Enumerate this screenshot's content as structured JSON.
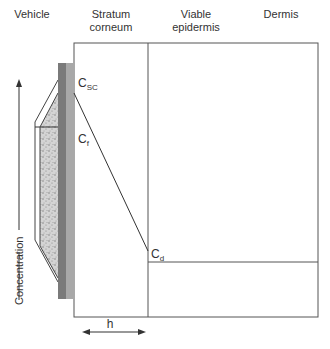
{
  "headers": {
    "vehicle": "Vehicle",
    "stratum_corneum_line1": "Stratum",
    "stratum_corneum_line2": "corneum",
    "viable_epidermis_line1": "Viable",
    "viable_epidermis_line2": "epidermis",
    "dermis": "Dermis"
  },
  "labels": {
    "c_sc_main": "C",
    "c_sc_sub": "SC",
    "c_f_main": "C",
    "c_f_sub": "f",
    "c_d_main": "C",
    "c_d_sub": "d",
    "h": "h",
    "concentration": "Concentration"
  },
  "colors": {
    "line": "#555555",
    "dark_bar": "#7a7a7a",
    "light_bar": "#a8a8a8",
    "speckle": "#c8c8c8"
  }
}
